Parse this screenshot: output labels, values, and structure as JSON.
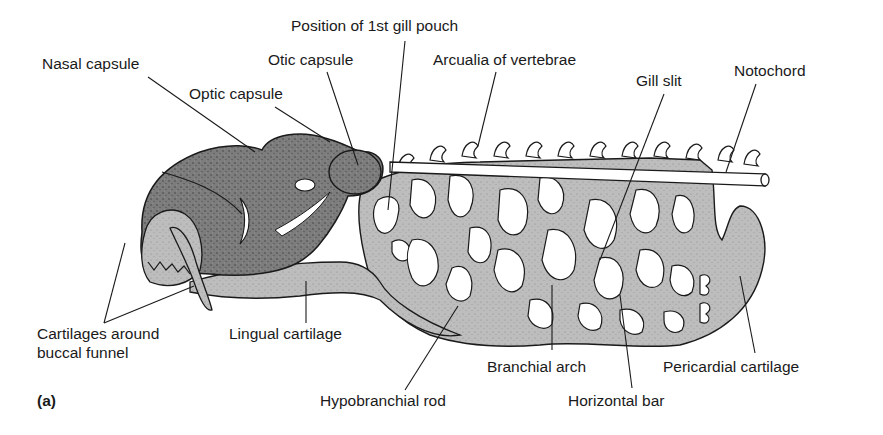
{
  "figure": {
    "panel_label": "(a)",
    "colors": {
      "dark_cartilage": "#7d7d7d",
      "light_cartilage": "#bdbdbd",
      "outline": "#1a1a1a",
      "background": "#ffffff"
    },
    "labels": {
      "nasal_capsule": "Nasal capsule",
      "optic_capsule": "Optic capsule",
      "otic_capsule": "Otic capsule",
      "first_gill_pouch": "Position of 1st gill pouch",
      "arcualia": "Arcualia of vertebrae",
      "gill_slit": "Gill slit",
      "notochord": "Notochord",
      "buccal_line1": "Cartilages around",
      "buccal_line2": "buccal funnel",
      "lingual": "Lingual cartilage",
      "hypobranchial": "Hypobranchial rod",
      "branchial_arch": "Branchial arch",
      "horizontal_bar": "Horizontal bar",
      "pericardial": "Pericardial cartilage"
    }
  }
}
